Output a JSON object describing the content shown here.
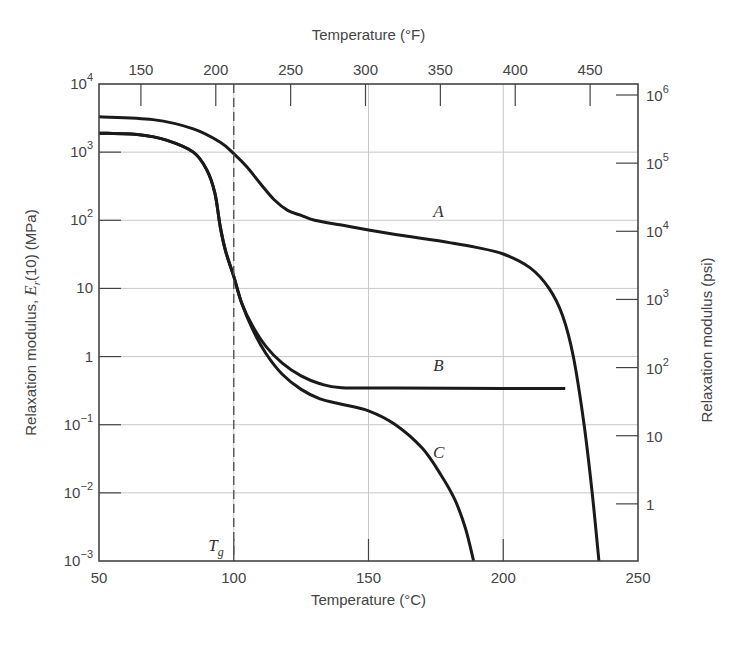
{
  "chart_data": {
    "type": "line",
    "title": "",
    "xlabel": "Temperature (°C)",
    "x2label": "Temperature (°F)",
    "ylabel": "Relaxation modulus, E_r(10) (MPa)",
    "ylabel_parts": {
      "pre": "Relaxation modulus, ",
      "sym": "E",
      "sub": "r",
      "post": "(10) (MPa)"
    },
    "y2label": "Relaxation modulus (psi)",
    "yscale": "log",
    "xlim": [
      50,
      250
    ],
    "ylim": [
      0.001,
      10000
    ],
    "grid": true,
    "x_ticks": [
      {
        "value": 50,
        "label": "50"
      },
      {
        "value": 100,
        "label": "100"
      },
      {
        "value": 150,
        "label": "150"
      },
      {
        "value": 200,
        "label": "200"
      },
      {
        "value": 250,
        "label": "250"
      }
    ],
    "x2_ticks_F": [
      {
        "value": 150,
        "label": "150"
      },
      {
        "value": 200,
        "label": "200"
      },
      {
        "value": 250,
        "label": "250"
      },
      {
        "value": 300,
        "label": "300"
      },
      {
        "value": 350,
        "label": "350"
      },
      {
        "value": 400,
        "label": "400"
      },
      {
        "value": 450,
        "label": "450"
      }
    ],
    "y_ticks": [
      {
        "exp": 4,
        "base": "10",
        "sup": "4"
      },
      {
        "exp": 3,
        "base": "10",
        "sup": "3"
      },
      {
        "exp": 2,
        "base": "10",
        "sup": "2"
      },
      {
        "exp": 1,
        "base": "10",
        "sup": ""
      },
      {
        "exp": 0,
        "base": "1",
        "sup": ""
      },
      {
        "exp": -1,
        "base": "10",
        "sup": "−1"
      },
      {
        "exp": -2,
        "base": "10",
        "sup": "−2"
      },
      {
        "exp": -3,
        "base": "10",
        "sup": "−3"
      }
    ],
    "y2_ticks_psi": [
      {
        "value": 1000000,
        "base": "10",
        "sup": "6"
      },
      {
        "value": 100000,
        "base": "10",
        "sup": "5"
      },
      {
        "value": 10000,
        "base": "10",
        "sup": "4"
      },
      {
        "value": 1000,
        "base": "10",
        "sup": "3"
      },
      {
        "value": 100,
        "base": "10",
        "sup": "2"
      },
      {
        "value": 10,
        "base": "10",
        "sup": ""
      },
      {
        "value": 1,
        "base": "1",
        "sup": ""
      }
    ],
    "annotations": [
      {
        "text": "T",
        "sub": "g",
        "x": 100,
        "note": "glass transition temperature, dashed vertical line"
      }
    ],
    "series": [
      {
        "name": "A",
        "label_pos": {
          "x": 176,
          "y": 110
        },
        "points": [
          [
            50,
            3300
          ],
          [
            70,
            3000
          ],
          [
            85,
            2200
          ],
          [
            95,
            1400
          ],
          [
            100,
            950
          ],
          [
            105,
            600
          ],
          [
            110,
            340
          ],
          [
            115,
            200
          ],
          [
            120,
            140
          ],
          [
            125,
            118
          ],
          [
            130,
            100
          ],
          [
            140,
            85
          ],
          [
            150,
            72
          ],
          [
            160,
            62
          ],
          [
            170,
            54
          ],
          [
            180,
            47
          ],
          [
            190,
            40
          ],
          [
            200,
            32
          ],
          [
            210,
            20
          ],
          [
            217,
            10
          ],
          [
            222,
            4
          ],
          [
            226,
            1
          ],
          [
            230,
            0.1
          ],
          [
            233,
            0.01
          ],
          [
            235.5,
            0.001
          ]
        ]
      },
      {
        "name": "B",
        "label_pos": {
          "x": 176,
          "y": 0.62
        },
        "points": [
          [
            50,
            1900
          ],
          [
            65,
            1800
          ],
          [
            75,
            1500
          ],
          [
            85,
            1000
          ],
          [
            90,
            550
          ],
          [
            93,
            250
          ],
          [
            95,
            80
          ],
          [
            97,
            35
          ],
          [
            100,
            15
          ],
          [
            103,
            6
          ],
          [
            107,
            2.8
          ],
          [
            112,
            1.4
          ],
          [
            118,
            0.8
          ],
          [
            125,
            0.52
          ],
          [
            132,
            0.4
          ],
          [
            140,
            0.35
          ],
          [
            160,
            0.345
          ],
          [
            200,
            0.34
          ],
          [
            223,
            0.34
          ]
        ]
      },
      {
        "name": "C",
        "label_pos": {
          "x": 176,
          "y": 0.032
        },
        "points": [
          [
            50,
            1900
          ],
          [
            65,
            1800
          ],
          [
            75,
            1500
          ],
          [
            85,
            1000
          ],
          [
            90,
            550
          ],
          [
            93,
            250
          ],
          [
            95,
            80
          ],
          [
            97,
            35
          ],
          [
            100,
            15
          ],
          [
            103,
            6
          ],
          [
            107,
            2.5
          ],
          [
            112,
            1.1
          ],
          [
            118,
            0.55
          ],
          [
            125,
            0.33
          ],
          [
            132,
            0.24
          ],
          [
            140,
            0.2
          ],
          [
            150,
            0.16
          ],
          [
            160,
            0.1
          ],
          [
            170,
            0.045
          ],
          [
            177,
            0.018
          ],
          [
            182,
            0.008
          ],
          [
            186,
            0.003
          ],
          [
            189,
            0.001
          ]
        ]
      }
    ],
    "colors": {
      "curve": "#1a1a1a",
      "frame": "#444444",
      "grid": "#c8c8c8",
      "text": "#444444"
    }
  }
}
